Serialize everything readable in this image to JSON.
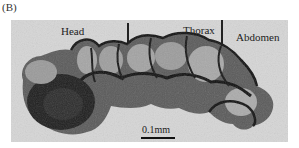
{
  "figure": {
    "panel_label": "(B)",
    "labels": {
      "head": "Head",
      "thorax": "Thorax",
      "abdomen": "Abdomen"
    },
    "scale_bar": {
      "text": "0.1mm"
    },
    "colors": {
      "background": "#d6d6d6",
      "specimen_dark": "#1a1a1a",
      "specimen_mid": "#6e6e6e",
      "specimen_light": "#b8b8b8"
    }
  }
}
